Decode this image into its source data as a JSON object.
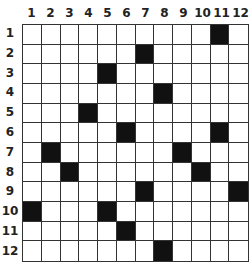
{
  "puzzle": {
    "rows": 12,
    "cols": 12,
    "column_labels": [
      "1",
      "2",
      "3",
      "4",
      "5",
      "6",
      "7",
      "8",
      "9",
      "10",
      "11",
      "12"
    ],
    "row_labels": [
      "1",
      "2",
      "3",
      "4",
      "5",
      "6",
      "7",
      "8",
      "9",
      "10",
      "11",
      "12"
    ],
    "black_cells": [
      [
        1,
        11
      ],
      [
        2,
        7
      ],
      [
        3,
        5
      ],
      [
        4,
        8
      ],
      [
        5,
        4
      ],
      [
        6,
        6
      ],
      [
        6,
        11
      ],
      [
        7,
        2
      ],
      [
        7,
        9
      ],
      [
        8,
        3
      ],
      [
        8,
        10
      ],
      [
        9,
        7
      ],
      [
        9,
        12
      ],
      [
        10,
        1
      ],
      [
        10,
        5
      ],
      [
        11,
        6
      ],
      [
        12,
        8
      ]
    ],
    "colors": {
      "black": "#111111",
      "white": "#ffffff",
      "grid_line": "#333333"
    }
  }
}
